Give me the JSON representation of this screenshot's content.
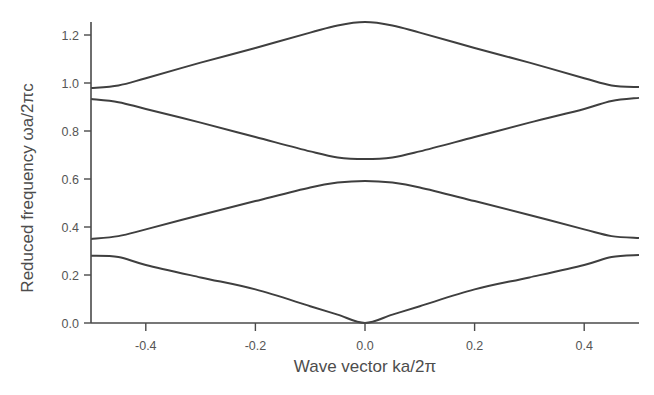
{
  "chart_data": {
    "type": "line",
    "title": "",
    "xlabel": "Wave vector ka/2π",
    "ylabel": "Reduced frequency ωa/2πc",
    "xlim": [
      -0.5,
      0.5
    ],
    "ylim": [
      0.0,
      1.25
    ],
    "grid": false,
    "legend": null,
    "xticks": [
      -0.4,
      -0.2,
      0.0,
      0.2,
      0.4
    ],
    "xtick_labels": [
      "-0.4",
      "-0.2",
      "0.0",
      "0.2",
      "0.4"
    ],
    "yticks": [
      0.0,
      0.2,
      0.4,
      0.6,
      0.8,
      1.0,
      1.2
    ],
    "ytick_labels": [
      "0.0",
      "0.2",
      "0.4",
      "0.6",
      "0.8",
      "1.0",
      "1.2"
    ],
    "x": [
      -0.5,
      -0.45,
      -0.4,
      -0.3,
      -0.2,
      -0.1,
      -0.05,
      0.0,
      0.05,
      0.1,
      0.2,
      0.3,
      0.4,
      0.45,
      0.5
    ],
    "series": [
      {
        "name": "Band 1",
        "values": [
          0.28,
          0.275,
          0.242,
          0.19,
          0.14,
          0.07,
          0.035,
          0.0,
          0.035,
          0.07,
          0.14,
          0.19,
          0.242,
          0.275,
          0.283
        ]
      },
      {
        "name": "Band 2",
        "values": [
          0.35,
          0.362,
          0.39,
          0.45,
          0.508,
          0.565,
          0.585,
          0.592,
          0.585,
          0.565,
          0.508,
          0.45,
          0.39,
          0.362,
          0.354
        ]
      },
      {
        "name": "Band 3",
        "values": [
          0.933,
          0.92,
          0.892,
          0.835,
          0.775,
          0.715,
          0.69,
          0.683,
          0.69,
          0.715,
          0.775,
          0.835,
          0.892,
          0.925,
          0.938
        ]
      },
      {
        "name": "Band 4",
        "values": [
          0.979,
          0.99,
          1.02,
          1.085,
          1.146,
          1.21,
          1.24,
          1.254,
          1.24,
          1.21,
          1.146,
          1.085,
          1.02,
          0.99,
          0.983
        ]
      }
    ]
  }
}
